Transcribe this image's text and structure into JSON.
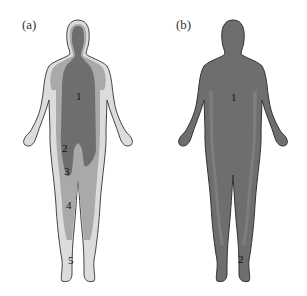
{
  "figure": {
    "panels": [
      {
        "label": "(a)",
        "colors": {
          "outline": "#444444",
          "outer": "#dcdcdc",
          "middle": "#a9a9a9",
          "core": "#6e6e6e"
        },
        "zones": [
          {
            "num": "1",
            "x": 78,
            "y": 95
          },
          {
            "num": "2",
            "x": 61,
            "y": 145
          },
          {
            "num": "3",
            "x": 64,
            "y": 168
          },
          {
            "num": "4",
            "x": 66,
            "y": 204
          },
          {
            "num": "5",
            "x": 69,
            "y": 258
          }
        ]
      },
      {
        "label": "(b)",
        "colors": {
          "outline": "#333333",
          "outer": "#6e6e6e",
          "middle": "#7a7a7a",
          "core": "#6a6a6a"
        },
        "zones": [
          {
            "num": "1",
            "x": 79,
            "y": 95
          },
          {
            "num": "2",
            "x": 86,
            "y": 257
          }
        ]
      }
    ]
  }
}
